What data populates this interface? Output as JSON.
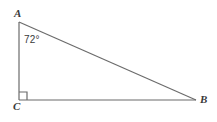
{
  "figure": {
    "type": "right-triangle-geometry-diagram",
    "background_color": "#ffffff",
    "stroke_color": "#6b6b6b",
    "text_color": "#3a3a3a",
    "vertices": {
      "A": {
        "label": "A",
        "x": 19,
        "y": 22
      },
      "B": {
        "label": "B",
        "x": 196,
        "y": 100
      },
      "C": {
        "label": "C",
        "x": 19,
        "y": 100
      }
    },
    "angle_marks": [
      {
        "at": "A",
        "label": "72°",
        "value": 72,
        "unit": "degrees"
      },
      {
        "at": "C",
        "label": "",
        "value": 90,
        "unit": "degrees",
        "marker": "right-angle-square"
      }
    ],
    "segments": [
      {
        "name": "AC",
        "from": "A",
        "to": "C"
      },
      {
        "name": "CB",
        "from": "C",
        "to": "B"
      },
      {
        "name": "AB",
        "from": "A",
        "to": "B"
      }
    ]
  }
}
